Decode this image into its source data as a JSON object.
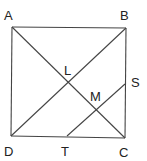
{
  "diagram": {
    "type": "geometry",
    "colors": {
      "stroke": "#444444",
      "label": "#222222",
      "background": "#ffffff"
    },
    "points": {
      "A": {
        "label": "A",
        "x": 12,
        "y": 27,
        "lx": 4,
        "ly": 20
      },
      "B": {
        "label": "B",
        "x": 126,
        "y": 28,
        "lx": 120,
        "ly": 20
      },
      "C": {
        "label": "C",
        "x": 125,
        "y": 138,
        "lx": 119,
        "ly": 157
      },
      "D": {
        "label": "D",
        "x": 11,
        "y": 136,
        "lx": 4,
        "ly": 156
      },
      "L": {
        "label": "L",
        "x": 68,
        "y": 82,
        "lx": 64,
        "ly": 75
      },
      "M": {
        "label": "M",
        "x": 96,
        "y": 109,
        "lx": 90,
        "ly": 101
      },
      "S": {
        "label": "S",
        "x": 125,
        "y": 84,
        "lx": 131,
        "ly": 87
      },
      "T": {
        "label": "T",
        "x": 67,
        "y": 136,
        "lx": 61,
        "ly": 156
      }
    },
    "segments": [
      {
        "from": "A",
        "to": "B"
      },
      {
        "from": "B",
        "to": "C"
      },
      {
        "from": "C",
        "to": "D"
      },
      {
        "from": "D",
        "to": "A"
      },
      {
        "from": "A",
        "to": "C"
      },
      {
        "from": "B",
        "to": "D"
      },
      {
        "from": "S",
        "to": "T"
      }
    ]
  }
}
